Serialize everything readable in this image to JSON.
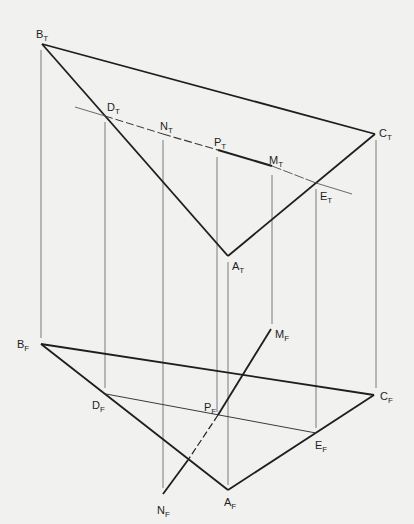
{
  "diagram": {
    "type": "descriptive-geometry-projection",
    "colors": {
      "background": "#f1f1f0",
      "ink": "#1e1e1e",
      "projector": "#7a7a7a"
    },
    "top_view": {
      "points": [
        {
          "id": "B_T",
          "letter": "B",
          "sub": "T",
          "x": 42,
          "y": 44
        },
        {
          "id": "C_T",
          "letter": "C",
          "sub": "T",
          "x": 375,
          "y": 134
        },
        {
          "id": "A_T",
          "letter": "A",
          "sub": "T",
          "x": 228,
          "y": 256
        },
        {
          "id": "D_T",
          "letter": "D",
          "sub": "T",
          "x": 105,
          "y": 116
        },
        {
          "id": "N_T",
          "letter": "N",
          "sub": "T",
          "x": 163,
          "y": 134
        },
        {
          "id": "P_T",
          "letter": "P",
          "sub": "T",
          "x": 218,
          "y": 150
        },
        {
          "id": "M_T",
          "letter": "M",
          "sub": "T",
          "x": 272,
          "y": 166
        },
        {
          "id": "E_T",
          "letter": "E",
          "sub": "T",
          "x": 316,
          "y": 183
        }
      ]
    },
    "front_view": {
      "points": [
        {
          "id": "B_F",
          "letter": "B",
          "sub": "F",
          "x": 41,
          "y": 344
        },
        {
          "id": "C_F",
          "letter": "C",
          "sub": "F",
          "x": 374,
          "y": 395
        },
        {
          "id": "A_F",
          "letter": "A",
          "sub": "F",
          "x": 228,
          "y": 490
        },
        {
          "id": "D_F",
          "letter": "D",
          "sub": "F",
          "x": 106,
          "y": 394
        },
        {
          "id": "E_F",
          "letter": "E",
          "sub": "F",
          "x": 316,
          "y": 433
        },
        {
          "id": "P_F",
          "letter": "P",
          "sub": "F",
          "x": 218,
          "y": 415
        },
        {
          "id": "M_F",
          "letter": "M",
          "sub": "F",
          "x": 271,
          "y": 329
        },
        {
          "id": "N_F",
          "letter": "N",
          "sub": "F",
          "x": 163,
          "y": 494
        }
      ]
    },
    "labels": [
      {
        "id": "B_T",
        "letter": "B",
        "sub": "T",
        "x": 36,
        "y": 38
      },
      {
        "id": "D_T",
        "letter": "D",
        "sub": "T",
        "x": 107,
        "y": 111
      },
      {
        "id": "N_T",
        "letter": "N",
        "sub": "T",
        "x": 160,
        "y": 130
      },
      {
        "id": "P_T",
        "letter": "P",
        "sub": "T",
        "x": 214,
        "y": 146
      },
      {
        "id": "M_T",
        "letter": "M",
        "sub": "T",
        "x": 269,
        "y": 164
      },
      {
        "id": "C_T",
        "letter": "C",
        "sub": "T",
        "x": 379,
        "y": 137
      },
      {
        "id": "E_T",
        "letter": "E",
        "sub": "T",
        "x": 320,
        "y": 200
      },
      {
        "id": "A_T",
        "letter": "A",
        "sub": "T",
        "x": 232,
        "y": 270
      },
      {
        "id": "M_F",
        "letter": "M",
        "sub": "F",
        "x": 275,
        "y": 338
      },
      {
        "id": "B_F",
        "letter": "B",
        "sub": "F",
        "x": 17,
        "y": 348
      },
      {
        "id": "C_F",
        "letter": "C",
        "sub": "F",
        "x": 380,
        "y": 400
      },
      {
        "id": "D_F",
        "letter": "D",
        "sub": "F",
        "x": 92,
        "y": 409
      },
      {
        "id": "P_F",
        "letter": "P",
        "sub": "F",
        "x": 204,
        "y": 411
      },
      {
        "id": "E_F",
        "letter": "E",
        "sub": "F",
        "x": 315,
        "y": 449
      },
      {
        "id": "A_F",
        "letter": "A",
        "sub": "F",
        "x": 224,
        "y": 506
      },
      {
        "id": "N_F",
        "letter": "N",
        "sub": "F",
        "x": 157,
        "y": 514
      }
    ]
  }
}
